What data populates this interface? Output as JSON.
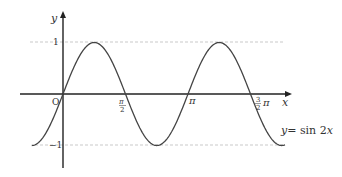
{
  "chart_data": {
    "type": "line",
    "title": "",
    "function": "y = sin 2x",
    "curve_label": "y = sin 2x",
    "xlabel": "x",
    "ylabel": "y",
    "origin_label": "O",
    "x_ticks": [
      {
        "value": 1.5708,
        "label": "π/2"
      },
      {
        "value": 3.1416,
        "label": "π"
      },
      {
        "value": 4.7124,
        "label": "3/2 π"
      }
    ],
    "y_ticks": [
      {
        "value": 1,
        "label": "1"
      },
      {
        "value": -1,
        "label": "-1"
      }
    ],
    "xlim": [
      -0.785,
      5.5
    ],
    "ylim": [
      -1,
      1
    ],
    "grid": false,
    "guides": "dashed horizontal lines at y=1 and y=-1",
    "x": [
      -0.785,
      0,
      0.785,
      1.571,
      2.356,
      3.142,
      3.927,
      4.712,
      5.498
    ],
    "values": [
      -1,
      0,
      1,
      0,
      -1,
      0,
      1,
      0,
      -1
    ]
  },
  "labels": {
    "y_axis": "y",
    "x_axis": "x",
    "origin": "O",
    "tick_one": "1",
    "tick_neg_one": "−1",
    "pi_half_num": "π",
    "pi_half_den": "2",
    "pi": "π",
    "three_half_num": "3",
    "three_half_den": "2",
    "three_half_pi": "π",
    "curve_y": "y",
    "curve_eq": "= sin 2",
    "curve_x": "x"
  }
}
